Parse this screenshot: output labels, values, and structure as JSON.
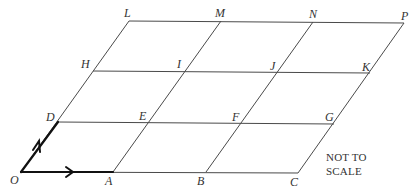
{
  "diagram": {
    "note_line1": "NOT TO",
    "note_line2": "SCALE",
    "labels": {
      "O": "O",
      "A": "A",
      "B": "B",
      "C": "C",
      "D": "D",
      "E": "E",
      "F": "F",
      "G": "G",
      "H": "H",
      "I": "I",
      "J": "J",
      "K": "K",
      "L": "L",
      "M": "M",
      "N": "N",
      "P": "P"
    },
    "vectors": [
      {
        "name": "OA",
        "from": "O",
        "to": "A",
        "arrow": true
      },
      {
        "name": "OD",
        "from": "O",
        "to": "D",
        "arrow": true
      }
    ],
    "rows": [
      [
        "O",
        "A",
        "B",
        "C"
      ],
      [
        "D",
        "E",
        "F",
        "G"
      ],
      [
        "H",
        "I",
        "J",
        "K"
      ],
      [
        "L",
        "M",
        "N",
        "P"
      ]
    ],
    "colors": {
      "line": "#4a4a4a",
      "vector": "#111111",
      "text": "#333333"
    }
  }
}
